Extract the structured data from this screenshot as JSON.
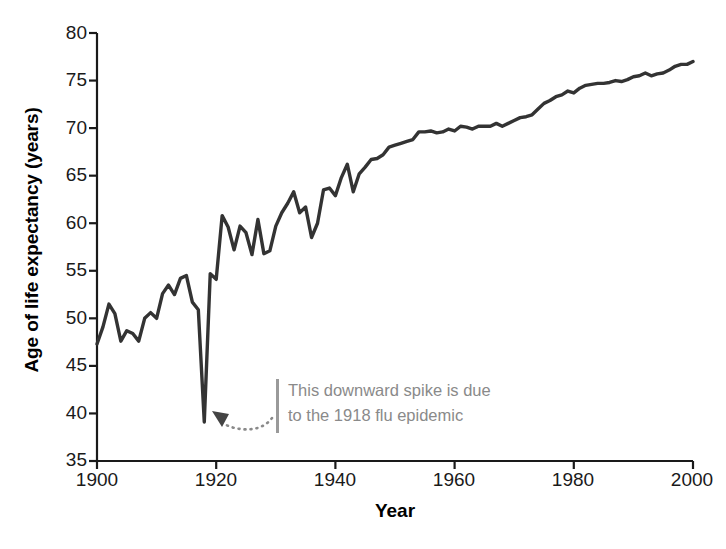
{
  "chart_data": {
    "type": "line",
    "title": "",
    "xlabel": "Year",
    "ylabel": "Age of life expectancy (years)",
    "xlim": [
      1900,
      2000
    ],
    "ylim": [
      35,
      80
    ],
    "xticks": [
      1900,
      1920,
      1940,
      1960,
      1980,
      2000
    ],
    "yticks": [
      35,
      40,
      45,
      50,
      55,
      60,
      65,
      70,
      75,
      80
    ],
    "grid": false,
    "legend": null,
    "line_color": "#333333",
    "annotations": [
      {
        "text_line_1": "This downward spike is due",
        "text_line_2": "to the 1918 flu epidemic",
        "color": "#8a8a8a",
        "points_to_year": 1918,
        "points_to_value": 39.1,
        "marker": "dotted-curved-arrow"
      }
    ],
    "x": [
      1900,
      1901,
      1902,
      1903,
      1904,
      1905,
      1906,
      1907,
      1908,
      1909,
      1910,
      1911,
      1912,
      1913,
      1914,
      1915,
      1916,
      1917,
      1918,
      1919,
      1920,
      1921,
      1922,
      1923,
      1924,
      1925,
      1926,
      1927,
      1928,
      1929,
      1930,
      1931,
      1932,
      1933,
      1934,
      1935,
      1936,
      1937,
      1938,
      1939,
      1940,
      1941,
      1942,
      1943,
      1944,
      1945,
      1946,
      1947,
      1948,
      1949,
      1950,
      1951,
      1952,
      1953,
      1954,
      1955,
      1956,
      1957,
      1958,
      1959,
      1960,
      1961,
      1962,
      1963,
      1964,
      1965,
      1966,
      1967,
      1968,
      1969,
      1970,
      1971,
      1972,
      1973,
      1974,
      1975,
      1976,
      1977,
      1978,
      1979,
      1980,
      1981,
      1982,
      1983,
      1984,
      1985,
      1986,
      1987,
      1988,
      1989,
      1990,
      1991,
      1992,
      1993,
      1994,
      1995,
      1996,
      1997,
      1998,
      1999,
      2000
    ],
    "y": [
      47.3,
      49.1,
      51.5,
      50.5,
      47.6,
      48.7,
      48.4,
      47.6,
      50.0,
      50.6,
      50.0,
      52.6,
      53.5,
      52.5,
      54.2,
      54.5,
      51.7,
      50.9,
      39.1,
      54.7,
      54.1,
      60.8,
      59.6,
      57.2,
      59.7,
      59.0,
      56.7,
      60.4,
      56.8,
      57.1,
      59.7,
      61.1,
      62.1,
      63.3,
      61.1,
      61.7,
      58.5,
      60.0,
      63.5,
      63.7,
      62.9,
      64.8,
      66.2,
      63.3,
      65.2,
      65.9,
      66.7,
      66.8,
      67.2,
      68.0,
      68.2,
      68.4,
      68.6,
      68.8,
      69.6,
      69.6,
      69.7,
      69.5,
      69.6,
      69.9,
      69.7,
      70.2,
      70.1,
      69.9,
      70.2,
      70.2,
      70.2,
      70.5,
      70.2,
      70.5,
      70.8,
      71.1,
      71.2,
      71.4,
      72.0,
      72.6,
      72.9,
      73.3,
      73.5,
      73.9,
      73.7,
      74.2,
      74.5,
      74.6,
      74.7,
      74.7,
      74.8,
      75.0,
      74.9,
      75.1,
      75.4,
      75.5,
      75.8,
      75.5,
      75.7,
      75.8,
      76.1,
      76.5,
      76.7,
      76.7,
      77.0
    ]
  }
}
